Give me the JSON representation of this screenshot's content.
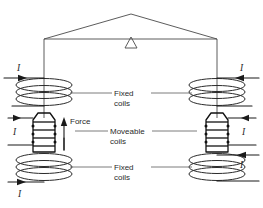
{
  "figure": {
    "background_color": "#ffffff",
    "line_color": "#1a1a1a"
  },
  "labels": {
    "fixed_coils_top": {
      "line1": "Fixed",
      "line2": "coils"
    },
    "moveable_coils": {
      "line1": "Moveable",
      "line2": "coils"
    },
    "fixed_coils_bottom": {
      "line1": "Fixed",
      "line2": "coils"
    },
    "force": "Force"
  },
  "currents": [
    {
      "id": "current-top-left",
      "symbol": "I",
      "direction": "right"
    },
    {
      "id": "current-top-right",
      "symbol": "I",
      "direction": "left"
    },
    {
      "id": "current-mid-left",
      "symbol": "I",
      "direction": "right"
    },
    {
      "id": "current-mid-right",
      "symbol": "I",
      "direction": "left"
    },
    {
      "id": "current-bottom-left",
      "symbol": "I",
      "direction": "right"
    },
    {
      "id": "current-bottom-right",
      "symbol": "I",
      "direction": "left"
    }
  ],
  "components": {
    "balance_beam": "balance-beam",
    "fulcrum": "fulcrum-triangle",
    "suspension_left": "suspension-wire-left",
    "suspension_right": "suspension-wire-right",
    "coils": [
      {
        "name": "fixed-coil-top-left",
        "type": "fixed",
        "turns": 3
      },
      {
        "name": "fixed-coil-top-right",
        "type": "fixed",
        "turns": 3
      },
      {
        "name": "moveable-coil-left",
        "type": "moveable",
        "turns": 4
      },
      {
        "name": "moveable-coil-right",
        "type": "moveable",
        "turns": 4
      },
      {
        "name": "fixed-coil-bottom-left",
        "type": "fixed",
        "turns": 3
      },
      {
        "name": "fixed-coil-bottom-right",
        "type": "fixed",
        "turns": 3
      }
    ],
    "force_arrows": [
      {
        "name": "force-arrow-left-inner",
        "direction": "up"
      },
      {
        "name": "force-arrow-left-outer",
        "direction": "up"
      }
    ]
  }
}
